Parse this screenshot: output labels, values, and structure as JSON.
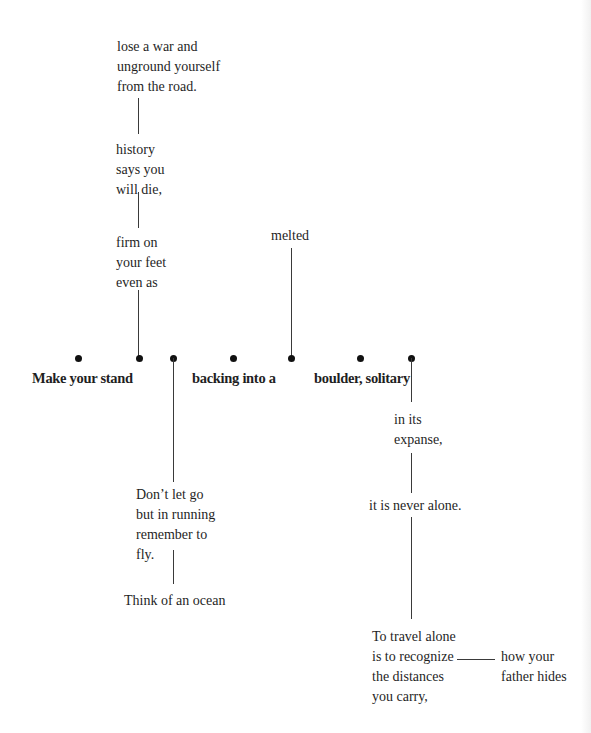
{
  "poem": {
    "top": {
      "stanza_1": [
        "lose a war and",
        "unground yourself",
        "from the road."
      ],
      "stanza_2": [
        "history",
        "says you",
        "will die,"
      ],
      "stanza_3": [
        "firm on",
        "your feet",
        "even as"
      ],
      "melted": "melted"
    },
    "main_line": {
      "phrase_1": "Make your stand",
      "phrase_2": "backing into a",
      "phrase_3": "boulder, solitary"
    },
    "left_branch": {
      "stanza_1": [
        "Don’t let go",
        "but in running",
        "remember to",
        "fly."
      ],
      "stanza_2": "Think of an ocean"
    },
    "right_branch": {
      "stanza_1": [
        "in its",
        "expanse,"
      ],
      "stanza_2": "it is never alone.",
      "stanza_3": [
        "To travel alone",
        "is to recognize",
        "the distances",
        "you carry,"
      ],
      "side_note": [
        "how your",
        "father hides"
      ]
    }
  },
  "colors": {
    "text": "#1f1f1f",
    "line": "#3a3a3a",
    "dot": "#111111",
    "background": "#ffffff"
  }
}
